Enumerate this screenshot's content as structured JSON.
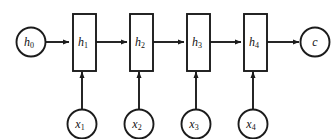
{
  "diagram": {
    "type": "rnn-unrolled-computation-graph",
    "stroke_color": "#1b1b1b",
    "background_color": "#ffffff",
    "initial_state": {
      "name": "h0",
      "base": "h",
      "subscript": "0",
      "shape": "circle"
    },
    "hidden_states": [
      {
        "name": "h1",
        "base": "h",
        "subscript": "1",
        "shape": "rectangle"
      },
      {
        "name": "h2",
        "base": "h",
        "subscript": "2",
        "shape": "rectangle"
      },
      {
        "name": "h3",
        "base": "h",
        "subscript": "3",
        "shape": "rectangle"
      },
      {
        "name": "h4",
        "base": "h",
        "subscript": "4",
        "shape": "rectangle"
      }
    ],
    "inputs": [
      {
        "name": "x1",
        "base": "x",
        "subscript": "1",
        "shape": "circle"
      },
      {
        "name": "x2",
        "base": "x",
        "subscript": "2",
        "shape": "circle"
      },
      {
        "name": "x3",
        "base": "x",
        "subscript": "3",
        "shape": "circle"
      },
      {
        "name": "x4",
        "base": "x",
        "subscript": "4",
        "shape": "circle"
      }
    ],
    "output": {
      "name": "c",
      "base": "c",
      "subscript": "",
      "shape": "circle"
    }
  }
}
